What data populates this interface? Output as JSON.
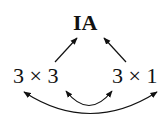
{
  "diagram": {
    "nodes": {
      "top": "IA",
      "left": "3 × 3",
      "right": "3 × 1"
    },
    "edges": [
      {
        "from": "3 × 3",
        "to": "IA",
        "type": "arrow"
      },
      {
        "from": "3 × 1",
        "to": "IA",
        "type": "arrow"
      },
      {
        "from": "3 × 3",
        "to": "3 × 1",
        "type": "double-arrow-arc",
        "position": "inner"
      },
      {
        "from": "3 × 3",
        "to": "3 × 1",
        "type": "double-arrow-arc",
        "position": "outer"
      }
    ],
    "colors": {
      "ink": "#111111",
      "background": "#ffffff"
    }
  }
}
